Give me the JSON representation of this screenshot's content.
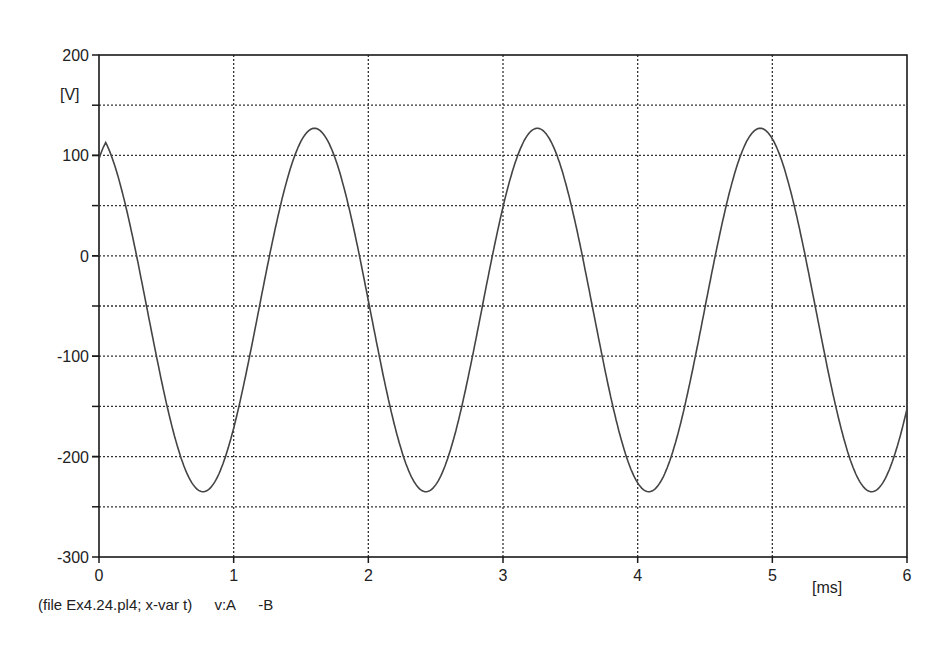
{
  "chart_data": {
    "type": "line",
    "title": "",
    "xlabel": "[ms]",
    "ylabel": "[V]",
    "xlim": [
      0,
      6
    ],
    "ylim": [
      -300,
      200
    ],
    "x_ticks": [
      0,
      1,
      2,
      3,
      4,
      5,
      6
    ],
    "y_ticks": [
      200,
      100,
      0,
      -100,
      -200,
      -300
    ],
    "grid": true,
    "grid_style": "dotted",
    "y_gridlines": [
      150,
      100,
      50,
      0,
      -50,
      -100,
      -150,
      -200,
      -250
    ],
    "x_gridlines": [
      1,
      2,
      3,
      4,
      5
    ],
    "series": [
      {
        "name": "v:A -B",
        "description": "Sinusoidal voltage, offset about -55 V, amplitude about 180 V, period about 1.67 ms",
        "x": [
          0,
          0.1,
          0.2,
          0.3,
          0.4,
          0.5,
          0.6,
          0.7,
          0.8,
          0.9,
          1.0,
          1.1,
          1.2,
          1.3,
          1.4,
          1.5,
          1.6,
          1.7,
          1.8,
          1.9,
          2.0,
          2.1,
          2.2,
          2.3,
          2.4,
          2.5,
          2.6,
          2.7,
          2.8,
          2.9,
          3.0,
          3.1,
          3.2,
          3.3,
          3.4,
          3.5,
          3.6,
          3.7,
          3.8,
          3.9,
          4.0,
          4.1,
          4.2,
          4.3,
          4.4,
          4.5,
          4.6,
          4.7,
          4.8,
          4.9,
          5.0,
          5.1,
          5.2,
          5.3,
          5.4,
          5.5,
          5.6,
          5.7,
          5.8,
          5.9,
          6.0
        ],
        "values": [
          100,
          62,
          4,
          -66,
          -134,
          -189,
          -225,
          -236,
          -222,
          -183,
          -126,
          -56,
          17,
          78,
          118,
          127,
          126,
          98,
          46,
          -21,
          -94,
          -157,
          -207,
          -231,
          -232,
          -208,
          -160,
          -97,
          -25,
          44,
          98,
          126,
          127,
          108,
          65,
          2,
          -70,
          -139,
          -194,
          -227,
          -234,
          -218,
          -177,
          -117,
          -47,
          25,
          84,
          120,
          127,
          123,
          92,
          36,
          -32,
          -104,
          -167,
          -214,
          -233,
          -230,
          -200,
          -150,
          -120
        ]
      }
    ],
    "peaks_ms": [
      1.6,
      3.25,
      4.9
    ],
    "troughs_ms": [
      0.7,
      2.35,
      4.05,
      5.7
    ]
  },
  "labels": {
    "y_unit": "[V]",
    "x_unit": "[ms]",
    "footer_file": "(file Ex4.24.pl4; x-var t)",
    "footer_var": "v:A",
    "footer_ref": "-B"
  },
  "y_tick_labels": [
    "200",
    "100",
    "0",
    "-100",
    "-200",
    "-300"
  ],
  "x_tick_labels": [
    "0",
    "1",
    "2",
    "3",
    "4",
    "5",
    "6"
  ],
  "colors": {
    "frame": "#1a1a1a",
    "grid": "#333333",
    "trace": "#444444",
    "background": "#ffffff"
  }
}
